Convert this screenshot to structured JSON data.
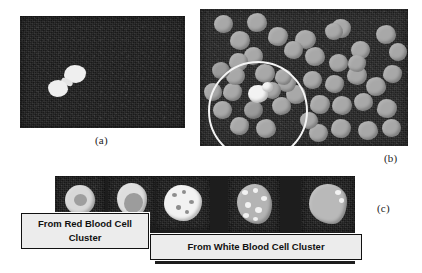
{
  "figure": {
    "panels": [
      {
        "id": "a",
        "letter": "(a)",
        "kind": "micrograph",
        "description": "Dark field microscopy image containing a small pair of bright overlapping cells"
      },
      {
        "id": "b",
        "letter": "(b)",
        "kind": "micrograph",
        "description": "Dark field microscopy image with many gray red blood cells and one bright white blood cell circled"
      },
      {
        "id": "c",
        "letter": "(c)",
        "kind": "crop-row",
        "description": "Row of segmented cell crops with two caption boxes"
      }
    ],
    "captions": [
      {
        "id": "red-cluster",
        "lines": [
          "From Red Blood Cell",
          "Cluster"
        ]
      },
      {
        "id": "white-cluster",
        "lines": [
          "From White Blood Cell Cluster"
        ]
      }
    ],
    "crops": [
      {
        "id": "crop-1",
        "group": "red-cluster",
        "label": "red blood cell crop 1"
      },
      {
        "id": "crop-2",
        "group": "red-cluster",
        "label": "red blood cell crop 2"
      },
      {
        "id": "crop-3",
        "group": "white-cluster",
        "label": "white blood cell crop 1"
      },
      {
        "id": "crop-4",
        "group": "white-cluster",
        "label": "white blood cell crop 2"
      },
      {
        "id": "crop-5",
        "group": "white-cluster",
        "label": "white blood cell crop 3"
      }
    ],
    "colors": {
      "background": "#ffffff",
      "micrograph_background": "#1d1d1d",
      "cell_gray": "#a8a8a8",
      "cell_bright": "#f2f2f2",
      "annotation_circle": "#f4f4f4",
      "label_box_fill": "#ececec",
      "label_box_border": "#111111",
      "caption_text": "#1c1c1c"
    },
    "annotations": [
      {
        "id": "selection-circle",
        "panel": "b",
        "shape": "circle",
        "color": "#f4f4f4"
      }
    ]
  }
}
